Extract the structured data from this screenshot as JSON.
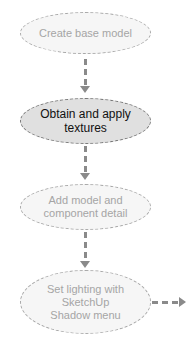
{
  "diagram": {
    "nodes": [
      {
        "label": "Create base model",
        "state": "inactive"
      },
      {
        "label": "Obtain and apply\ntextures",
        "state": "active"
      },
      {
        "label": "Add model and\ncomponent detail",
        "state": "inactive"
      },
      {
        "label": "Set lighting with\nSketchUp\nShadow menu",
        "state": "inactive"
      }
    ],
    "colors": {
      "active_fill": "#e0e0e0",
      "inactive_fill": "#f6f6f6",
      "connector": "#8a8a8a"
    }
  }
}
